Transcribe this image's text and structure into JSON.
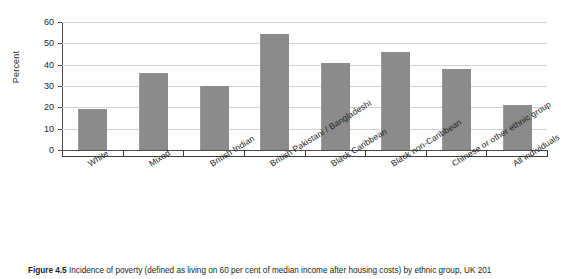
{
  "chart_data": {
    "type": "bar",
    "title": "",
    "xlabel": "",
    "ylabel": "Percent",
    "ylim": [
      0,
      60
    ],
    "ytick_values": [
      0,
      10,
      20,
      30,
      40,
      50,
      60
    ],
    "ytick_labels": [
      "0",
      "10",
      "20",
      "30",
      "40",
      "50",
      "60"
    ],
    "grid": "horizontal",
    "legend": "none",
    "bar_color": "#8b8b8b",
    "categories": [
      "White",
      "Mixed",
      "British Indian",
      "British Pakistani / Bangladeshi",
      "Black Caribbean",
      "Black non-Caribbean",
      "Chinese or other ethnic group",
      "All individuals"
    ],
    "values": [
      19,
      36,
      30,
      54.5,
      41,
      46,
      38,
      21
    ],
    "series": [
      {
        "name": "Incidence of poverty",
        "values": [
          19,
          36,
          30,
          54.5,
          41,
          46,
          38,
          21
        ]
      }
    ]
  },
  "axes": {
    "y_title": "Percent",
    "y_ticks": [
      "60",
      "50",
      "40",
      "30",
      "20",
      "10",
      "0"
    ]
  },
  "caption": {
    "figure_number": "Figure 4.5",
    "text": "Incidence of poverty (defined as living on 60 per cent of median income after housing costs) by ethnic group, UK 201",
    "full": "Figure 4.5 Incidence of poverty (defined as living on 60 per cent of median income after housing costs) by ethnic group, UK 201"
  }
}
